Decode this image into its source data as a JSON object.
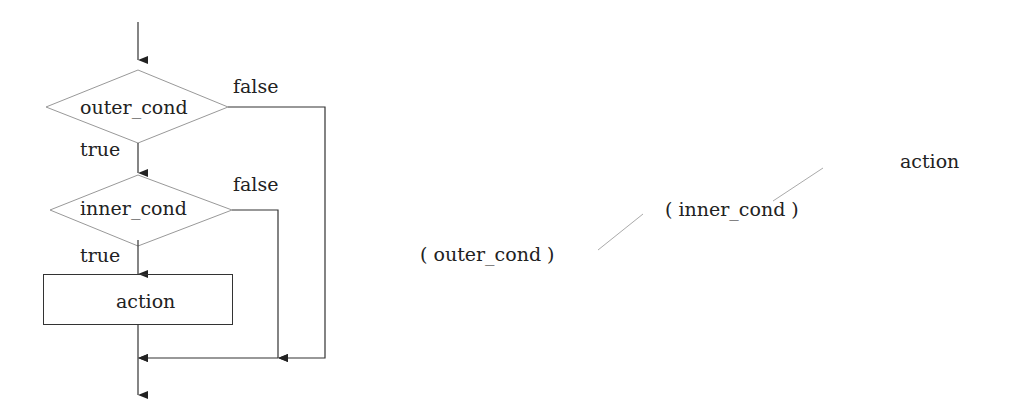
{
  "flowchart": {
    "outer_decision": "outer_cond",
    "inner_decision": "inner_cond",
    "action": "action",
    "outer_true": "true",
    "outer_false": "false",
    "inner_true": "true",
    "inner_false": "false"
  },
  "tree": {
    "outer": "( outer_cond )",
    "inner": "( inner_cond )",
    "leaf": "action"
  },
  "colors": {
    "line": "#333333",
    "shape": "#999999",
    "tree_line": "#aaaaaa"
  }
}
